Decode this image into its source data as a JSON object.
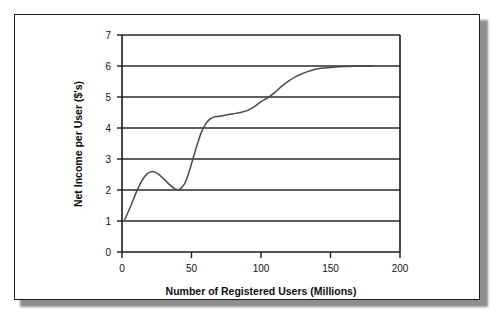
{
  "chart_data": {
    "type": "line",
    "title": "",
    "xlabel": "Number of Registered Users (Millions)",
    "ylabel": "Net Income per User ($'s)",
    "xlim": [
      0,
      200
    ],
    "ylim": [
      0,
      7
    ],
    "xticks": [
      "0",
      "50",
      "100",
      "150",
      "200"
    ],
    "xtick_values": [
      0,
      50,
      100,
      150,
      200
    ],
    "yticks": [
      "0",
      "1",
      "2",
      "3",
      "4",
      "5",
      "6",
      "7"
    ],
    "ytick_values": [
      0,
      1,
      2,
      3,
      4,
      5,
      6,
      7
    ],
    "grid": "horizontal",
    "legend": "none",
    "series": [
      {
        "name": "Net income per user",
        "color": "#4a4a4a",
        "x": [
          2,
          6,
          10,
          14,
          18,
          22,
          26,
          30,
          34,
          38,
          41,
          45,
          48,
          51,
          54,
          57,
          60,
          63,
          66,
          70,
          75,
          80,
          85,
          90,
          95,
          100,
          105,
          110,
          115,
          120,
          125,
          130,
          140,
          150,
          160,
          170,
          180
        ],
        "y": [
          1.05,
          1.45,
          1.9,
          2.28,
          2.52,
          2.6,
          2.52,
          2.36,
          2.18,
          2.04,
          2.02,
          2.2,
          2.55,
          3.0,
          3.45,
          3.85,
          4.12,
          4.28,
          4.35,
          4.38,
          4.42,
          4.46,
          4.5,
          4.56,
          4.68,
          4.85,
          4.98,
          5.15,
          5.35,
          5.52,
          5.66,
          5.76,
          5.9,
          5.95,
          5.98,
          6.0,
          6.0
        ]
      }
    ],
    "annotations": {
      "local_max": {
        "x": 22,
        "y": 2.6
      },
      "local_min": {
        "x": 41,
        "y": 2.02
      },
      "plateau": {
        "x_range": [
          63,
          90
        ],
        "y": 4.4
      },
      "asymptote": {
        "y": 6.0
      }
    }
  },
  "colors": {
    "curve": "#4a4a4a",
    "axis": "#1b1b1b",
    "grid": "#2a2a2a",
    "frame": "#1b1b1b",
    "background": "#ffffff",
    "shadow": "#8e8e8e"
  }
}
